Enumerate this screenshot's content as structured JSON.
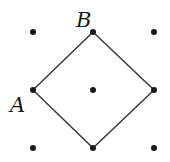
{
  "diagram": {
    "type": "lattice-square",
    "grid": {
      "columns_x": [
        33,
        93,
        154
      ],
      "rows_y": [
        32,
        90,
        148
      ],
      "dot_color": "#1a1a1a",
      "dot_radius": 3
    },
    "square": {
      "vertices": [
        [
          93,
          32
        ],
        [
          154,
          90
        ],
        [
          93,
          148
        ],
        [
          33,
          90
        ]
      ],
      "stroke": "#333333"
    },
    "labels": [
      {
        "text": "B",
        "x": 76,
        "y": 27,
        "name": "label-b"
      },
      {
        "text": "A",
        "x": 10,
        "y": 112,
        "name": "label-a"
      }
    ]
  }
}
